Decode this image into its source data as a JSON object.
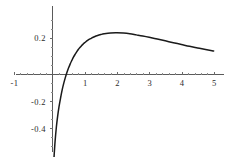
{
  "chart_data": {
    "type": "line",
    "title": "",
    "subtitle": "",
    "xlabel": "",
    "ylabel": "",
    "xlim": [
      -1,
      5
    ],
    "ylim": [
      -0.52,
      0.31
    ],
    "grid": false,
    "legend": false,
    "legend_position": "none",
    "x_ticks": [
      -1,
      1,
      2,
      3,
      4,
      5
    ],
    "x_tick_labels": [
      "-1",
      "1",
      "2",
      "3",
      "4",
      "5"
    ],
    "y_ticks": [
      0.2,
      -0.2,
      -0.4
    ],
    "y_tick_labels": [
      "0.2",
      "-0.2",
      "-0.4"
    ],
    "annotations": [],
    "series": [
      {
        "name": "curve",
        "color": "#1a1a1a",
        "x": [
          0.03,
          0.05,
          0.08,
          0.12,
          0.16,
          0.2,
          0.25,
          0.3,
          0.35,
          0.4,
          0.45,
          0.5,
          0.55,
          0.6,
          0.65,
          0.7,
          0.75,
          0.8,
          0.85,
          0.9,
          0.95,
          1.0,
          1.1,
          1.2,
          1.3,
          1.4,
          1.5,
          1.6,
          1.8,
          2.0,
          2.2,
          2.4,
          2.6,
          2.8,
          3.0,
          3.25,
          3.5,
          3.75,
          4.0,
          4.25,
          4.5,
          4.75,
          5.0
        ],
        "y": [
          -0.51,
          -0.45,
          -0.37,
          -0.29,
          -0.23,
          -0.18,
          -0.13,
          -0.085,
          -0.048,
          -0.016,
          0.012,
          0.037,
          0.059,
          0.078,
          0.096,
          0.111,
          0.125,
          0.138,
          0.149,
          0.159,
          0.168,
          0.176,
          0.19,
          0.2,
          0.209,
          0.216,
          0.221,
          0.225,
          0.23,
          0.231,
          0.229,
          0.225,
          0.219,
          0.213,
          0.206,
          0.196,
          0.186,
          0.176,
          0.166,
          0.156,
          0.147,
          0.138,
          0.13
        ]
      }
    ]
  },
  "axes": {
    "x_axis_name": "horizontal-axis",
    "y_axis_name": "vertical-axis"
  }
}
